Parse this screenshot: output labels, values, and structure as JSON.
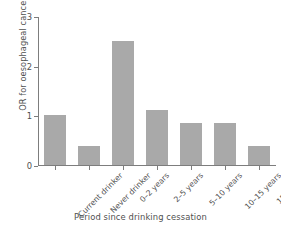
{
  "chart_data": {
    "type": "bar",
    "title": "",
    "xlabel": "Period since drinking cessation",
    "ylabel": "OR for oesophageal cancer",
    "categories": [
      "Current drinker",
      "Never drinker",
      "0–2 years",
      "2–5 years",
      "5–10 years",
      "10–15 years",
      "15+ years"
    ],
    "values": [
      1.0,
      0.38,
      2.5,
      1.1,
      0.85,
      0.85,
      0.38
    ],
    "ylim": [
      0,
      3
    ],
    "yticks": [
      "0",
      "1",
      "2",
      "3"
    ],
    "ytick_values": [
      0,
      1,
      2,
      3
    ],
    "grid": false,
    "legend": "none",
    "bar_color": "#a9a9a9",
    "axis_color": "#7d7d7d",
    "background_color": "#ffffff"
  }
}
